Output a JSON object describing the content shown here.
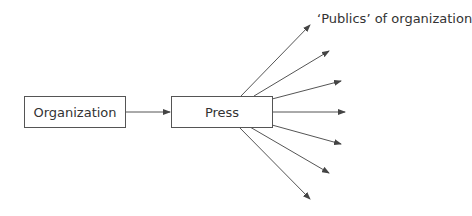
{
  "diagram": {
    "title": "",
    "nodes": {
      "organization": {
        "label": "Organization"
      },
      "press": {
        "label": "Press"
      }
    },
    "publics_label": "‘Publics’ of organization",
    "edges": [
      {
        "from": "Organization",
        "to": "Press"
      },
      {
        "from": "Press",
        "to": "Public 1"
      },
      {
        "from": "Press",
        "to": "Public 2"
      },
      {
        "from": "Press",
        "to": "Public 3"
      },
      {
        "from": "Press",
        "to": "Public 4"
      },
      {
        "from": "Press",
        "to": "Public 5"
      },
      {
        "from": "Press",
        "to": "Public 6"
      },
      {
        "from": "Press",
        "to": "Public 7"
      }
    ],
    "colors": {
      "line": "#555555",
      "text": "#333333",
      "background": "#ffffff"
    }
  }
}
